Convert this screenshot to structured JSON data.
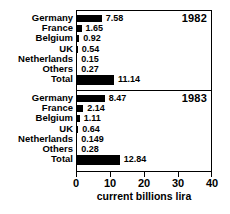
{
  "chart_data": {
    "type": "bar",
    "orientation": "horizontal",
    "title": "",
    "xlabel": "current billions lira",
    "ylabel": "",
    "xlim": [
      0,
      40
    ],
    "xticks": [
      0,
      10,
      20,
      30,
      40
    ],
    "xtick_labels": [
      "0",
      "10",
      "20",
      "30",
      "40"
    ],
    "grid": false,
    "legend": null,
    "categories": [
      "Germany",
      "France",
      "Belgium",
      "UK",
      "Netherlands",
      "Others",
      "Total"
    ],
    "panels": [
      {
        "year": "1982",
        "values": [
          7.58,
          1.65,
          0.92,
          0.54,
          0.15,
          0.27,
          11.14
        ],
        "value_labels": [
          "7.58",
          "1.65",
          "0.92",
          "0.54",
          "0.15",
          "0.27",
          "11.14"
        ]
      },
      {
        "year": "1983",
        "values": [
          8.47,
          2.14,
          1.11,
          0.64,
          0.149,
          0.28,
          12.84
        ],
        "value_labels": [
          "8.47",
          "2.14",
          "1.11",
          "0.64",
          "0.149",
          "0.28",
          "12.84"
        ]
      }
    ],
    "series": [
      {
        "name": "1982",
        "values": [
          7.58,
          1.65,
          0.92,
          0.54,
          0.15,
          0.27,
          11.14
        ]
      },
      {
        "name": "1983",
        "values": [
          8.47,
          2.14,
          1.11,
          0.64,
          0.149,
          0.28,
          12.84
        ]
      }
    ],
    "bar_color": "#000000",
    "background_color": "#ffffff"
  }
}
